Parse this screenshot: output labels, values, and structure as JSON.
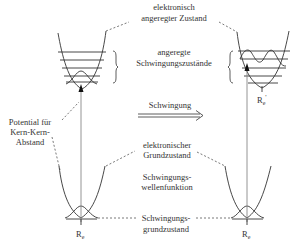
{
  "labels": {
    "excited_state_line1": "elektronisch",
    "excited_state_line2": "angeregter Zustand",
    "excited_vib_line1": "angeregte",
    "excited_vib_line2": "Schwingungszustände",
    "potential_line1": "Potential für",
    "potential_line2": "Kern-Kern-",
    "potential_line3": "Abstand",
    "vibration": "Schwingung",
    "ground_state_line1": "elektronischer",
    "ground_state_line2": "Grundzustand",
    "wavefunction_line1": "Schwingungs-",
    "wavefunction_line2": "wellenfunktion",
    "vib_ground_line1": "Schwingungs-",
    "vib_ground_line2": "grundzustand",
    "re_left": "R",
    "re_left_sub": "e",
    "re_right": "R",
    "re_right_sub": "e",
    "re_prime": "R",
    "re_prime_sub": "e",
    "re_prime_mark": "'"
  },
  "colors": {
    "line": "#333333",
    "dashed": "#555555",
    "arrow_line": "#888888"
  }
}
